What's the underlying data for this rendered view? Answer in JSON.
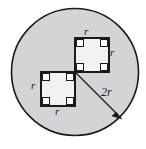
{
  "figure": {
    "colors": {
      "circle_fill": "#d4d4d4",
      "circle_stroke": "#1a1a1a",
      "square_fill": "#f2f2f2",
      "square_stroke": "#1a1a1a",
      "corner_marker_fill": "#ffffff",
      "corner_marker_stroke": "#1a1a1a",
      "arrow_stroke": "#1a1a1a",
      "background": "#ffffff",
      "label_color": "#1a1a1a"
    },
    "circle": {
      "name": "large-circle",
      "center_x": 75,
      "center_y": 72,
      "radius": 64,
      "radius_label": "2r"
    },
    "squares": [
      {
        "name": "upper-right-square",
        "x": 75,
        "y": 38,
        "side": 34,
        "side_label": "r",
        "corner_markers": 4
      },
      {
        "name": "lower-left-square",
        "x": 41,
        "y": 72,
        "side": 34,
        "side_label": "r",
        "corner_markers": 4
      }
    ],
    "labels": [
      {
        "id": "label-r-top",
        "name": "label-r-top-side",
        "text": "r"
      },
      {
        "id": "label-r-right",
        "name": "label-r-right-side",
        "text": "r"
      },
      {
        "id": "label-r-left",
        "name": "label-r-left-side",
        "text": "r"
      },
      {
        "id": "label-r-bottom",
        "name": "label-r-bottom-side",
        "text": "r"
      },
      {
        "id": "label-2r",
        "name": "label-radius-2r",
        "text": "2r"
      }
    ],
    "radius_arrow": {
      "name": "radius-arrow",
      "from_x": 75,
      "from_y": 72,
      "to_x": 120,
      "to_y": 117,
      "label": "2r"
    }
  }
}
